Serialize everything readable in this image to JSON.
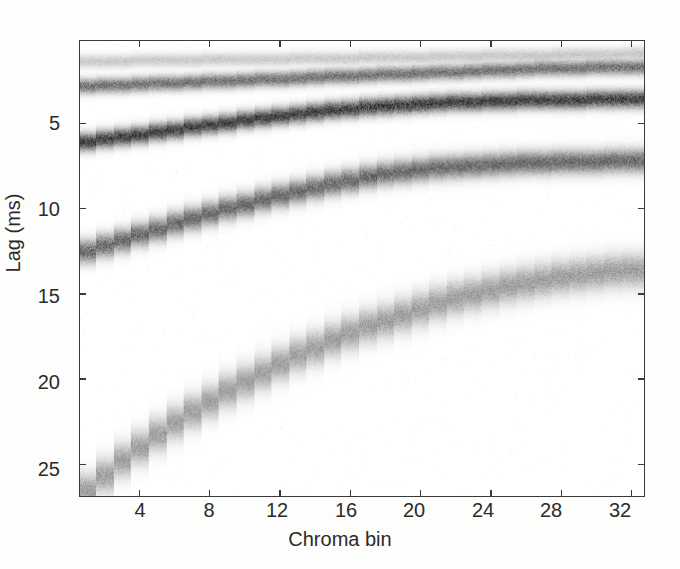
{
  "figure": {
    "kind": "grayscale-heatmap",
    "background_color": "#ffffff",
    "axis_color": "#3a3a3a",
    "text_color": "#2b2b2b"
  },
  "axes": {
    "xlabel": "Chroma bin",
    "ylabel": "Lag (ms)",
    "x_ticks": [
      4,
      8,
      12,
      16,
      20,
      24,
      28,
      32
    ],
    "x_tick_labels": [
      "4",
      "8",
      "12",
      "16",
      "20",
      "24",
      "28",
      "32"
    ],
    "y_ticks": [
      5,
      10,
      15,
      20,
      25
    ],
    "y_tick_labels": [
      "5",
      "10",
      "15",
      "20",
      "25"
    ],
    "xlim": [
      0.6,
      32.8
    ],
    "ylim_top_ms": 0.15,
    "ylim_bottom_ms": 26.95,
    "y_axis_inverted": true,
    "grid": false,
    "legend": false,
    "colorbar": false
  },
  "chart_data": {
    "type": "heatmap",
    "title": "",
    "xlabel": "Chroma bin",
    "ylabel": "Lag (ms)",
    "xlim": [
      0.6,
      32.8
    ],
    "ylim": [
      26.95,
      0.15
    ],
    "colormap": "gray-inverted",
    "value_range": [
      0,
      1
    ],
    "x": [
      1,
      2,
      3,
      4,
      5,
      6,
      7,
      8,
      9,
      10,
      11,
      12,
      13,
      14,
      15,
      16,
      17,
      18,
      19,
      20,
      21,
      22,
      23,
      24,
      25,
      26,
      27,
      28,
      29,
      30,
      31,
      32
    ],
    "ridges": [
      {
        "name": "ridge-1-faintest-top",
        "intensity": 0.22,
        "thickness_ms": 0.55,
        "lag_ms": [
          1.32,
          1.31,
          1.3,
          1.29,
          1.27,
          1.26,
          1.25,
          1.23,
          1.22,
          1.21,
          1.19,
          1.18,
          1.17,
          1.15,
          1.14,
          1.12,
          1.11,
          1.09,
          1.08,
          1.06,
          1.05,
          1.03,
          1.02,
          1.0,
          0.99,
          0.97,
          0.96,
          0.94,
          0.93,
          0.91,
          0.9,
          0.88
        ]
      },
      {
        "name": "ridge-2-upper-dark",
        "intensity": 0.58,
        "thickness_ms": 0.62,
        "lag_ms": [
          2.78,
          2.75,
          2.71,
          2.67,
          2.63,
          2.59,
          2.55,
          2.51,
          2.47,
          2.43,
          2.39,
          2.35,
          2.31,
          2.27,
          2.23,
          2.19,
          2.15,
          2.11,
          2.07,
          2.03,
          1.99,
          1.95,
          1.91,
          1.87,
          1.83,
          1.79,
          1.76,
          1.73,
          1.71,
          1.69,
          1.68,
          1.67
        ]
      },
      {
        "name": "ridge-3-darkest",
        "intensity": 0.8,
        "thickness_ms": 0.72,
        "lag_ms": [
          6.05,
          5.92,
          5.78,
          5.64,
          5.5,
          5.36,
          5.22,
          5.08,
          4.94,
          4.81,
          4.68,
          4.56,
          4.44,
          4.33,
          4.22,
          4.12,
          4.03,
          3.95,
          3.88,
          3.82,
          3.77,
          3.73,
          3.7,
          3.67,
          3.65,
          3.63,
          3.61,
          3.6,
          3.59,
          3.58,
          3.57,
          3.56
        ]
      },
      {
        "name": "ridge-4-middle",
        "intensity": 0.62,
        "thickness_ms": 0.95,
        "lag_ms": [
          12.55,
          12.2,
          11.86,
          11.53,
          11.21,
          10.9,
          10.6,
          10.31,
          10.03,
          9.76,
          9.5,
          9.25,
          9.01,
          8.78,
          8.56,
          8.35,
          8.15,
          7.96,
          7.83,
          7.72,
          7.62,
          7.54,
          7.47,
          7.41,
          7.36,
          7.32,
          7.29,
          7.26,
          7.24,
          7.22,
          7.2,
          7.18
        ]
      },
      {
        "name": "ridge-5-lowest-faint",
        "intensity": 0.4,
        "thickness_ms": 1.35,
        "lag_ms": [
          26.6,
          25.7,
          24.85,
          24.05,
          23.3,
          22.6,
          21.95,
          21.35,
          20.75,
          20.2,
          19.65,
          19.15,
          18.65,
          18.2,
          17.75,
          17.35,
          16.95,
          16.6,
          16.25,
          15.9,
          15.6,
          15.3,
          15.05,
          14.8,
          14.6,
          14.4,
          14.22,
          14.05,
          13.92,
          13.8,
          13.72,
          13.65
        ]
      }
    ],
    "step_quantized": true,
    "steps_per_octave_hint": "ridge lag forms discrete staircase, one step per chroma bin"
  }
}
